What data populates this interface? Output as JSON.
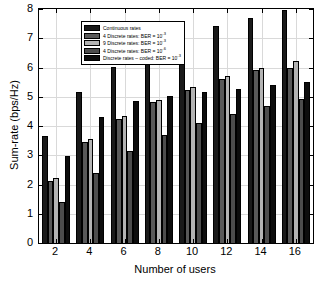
{
  "chart_data": {
    "type": "bar",
    "title": "",
    "xlabel": "Number of users",
    "ylabel": "Sum-rate (bps/Hz)",
    "categories": [
      "2",
      "4",
      "6",
      "8",
      "10",
      "12",
      "14",
      "16"
    ],
    "xlim": [
      1,
      17
    ],
    "ylim": [
      0,
      8
    ],
    "ytick_labels": [
      "0",
      "1",
      "2",
      "3",
      "4",
      "5",
      "6",
      "7",
      "8"
    ],
    "ytick_values": [
      0,
      1,
      2,
      3,
      4,
      5,
      6,
      7,
      8
    ],
    "xtick_values": [
      2,
      4,
      6,
      8,
      10,
      12,
      14,
      16
    ],
    "grid": true,
    "legend_position": "upper left",
    "series": [
      {
        "name": "Continuous rates",
        "color": "#1a1a1a",
        "values": [
          3.65,
          5.17,
          6.02,
          6.59,
          7.03,
          7.41,
          7.69,
          7.98
        ]
      },
      {
        "name": "4 Discrete rates: BER = 10^-3",
        "color": "#595959",
        "values": [
          2.12,
          3.44,
          4.24,
          4.81,
          5.24,
          5.6,
          5.91,
          6.0
        ]
      },
      {
        "name": "9 Discrete rates: BER = 10^-3",
        "color": "#b3b3b3",
        "values": [
          2.22,
          3.54,
          4.33,
          4.9,
          5.34,
          5.7,
          5.98,
          6.22
        ]
      },
      {
        "name": "4 Discrete rates: BER = 10^-6",
        "color": "#4d4d4d",
        "values": [
          1.39,
          2.41,
          3.14,
          3.68,
          4.1,
          4.41,
          4.7,
          4.94
        ]
      },
      {
        "name": "Discrete rates - coded: BER = 10^-3",
        "color": "#0d0d0d",
        "values": [
          2.98,
          4.31,
          4.85,
          5.02,
          5.15,
          5.26,
          5.39,
          5.49
        ]
      }
    ],
    "legend_entries": [
      {
        "label_prefix": "Continuous rates",
        "has_exponent": false,
        "exponent": ""
      },
      {
        "label_prefix": "4 Discrete rates: BER = 10",
        "has_exponent": true,
        "exponent": "-3"
      },
      {
        "label_prefix": "9 Discrete rates: BER = 10",
        "has_exponent": true,
        "exponent": "-3"
      },
      {
        "label_prefix": "4 Discrete rates: BER = 10",
        "has_exponent": true,
        "exponent": "-6"
      },
      {
        "label_prefix": "Discrete rates – coded: BER = 10",
        "has_exponent": true,
        "exponent": "-3"
      }
    ]
  }
}
